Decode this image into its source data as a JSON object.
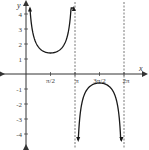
{
  "chart_data": {
    "type": "line",
    "title": "",
    "function_description": "y = csc(x) + 0.4 on (0, π) ∪ (π, 2π)",
    "xlabel": "x",
    "ylabel": "y",
    "xlim": [
      -1.6,
      2.4
    ],
    "ylim": [
      -4.9,
      4.9
    ],
    "x_ticks": [
      {
        "value": 1.5708,
        "label": "π/2"
      },
      {
        "value": 3.1416,
        "label": "π"
      },
      {
        "value": 4.7124,
        "label": "3π/2"
      },
      {
        "value": 6.2832,
        "label": "2π"
      }
    ],
    "y_ticks": [
      {
        "value": 4,
        "label": "4"
      },
      {
        "value": 3,
        "label": "3"
      },
      {
        "value": 2,
        "label": "2"
      },
      {
        "value": 1,
        "label": "1"
      },
      {
        "value": -1,
        "label": "-1"
      },
      {
        "value": -2,
        "label": "-2"
      },
      {
        "value": -3,
        "label": "-3"
      },
      {
        "value": -4,
        "label": "-4"
      }
    ],
    "asymptotes": [
      {
        "x": 3.1416,
        "label": "x = π",
        "style": "dashed"
      },
      {
        "x": 6.2832,
        "label": "x = 2π",
        "style": "dashed"
      }
    ],
    "series": [
      {
        "name": "upper branch (0, π)",
        "x": [
          0.1,
          0.2,
          0.35,
          0.5,
          0.75,
          1.0,
          1.25,
          1.5708,
          1.9,
          2.15,
          2.4,
          2.65,
          2.8,
          2.95,
          3.04
        ],
        "values": [
          4.1,
          4.1,
          3.26,
          2.49,
          1.88,
          1.59,
          1.45,
          1.4,
          1.45,
          1.63,
          1.88,
          2.49,
          3.26,
          4.1,
          4.1
        ]
      },
      {
        "name": "lower branch (π, 2π)",
        "x": [
          3.24,
          3.34,
          3.5,
          3.7,
          3.95,
          4.2,
          4.45,
          4.7124,
          5.0,
          5.25,
          5.5,
          5.75,
          5.95,
          6.1,
          6.18
        ],
        "values": [
          -4.1,
          -4.1,
          -2.46,
          -1.5,
          -0.97,
          -0.75,
          -0.64,
          -0.6,
          -0.64,
          -0.75,
          -0.97,
          -1.5,
          -2.46,
          -4.1,
          -4.1
        ]
      }
    ],
    "grid": false,
    "legend": null,
    "colors": {
      "curve": "#1a1a1a",
      "axes": "#333333",
      "asymptote": "#555555"
    }
  }
}
